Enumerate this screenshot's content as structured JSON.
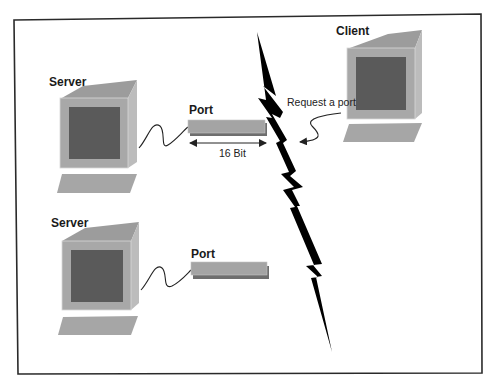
{
  "diagram": {
    "type": "client-server port request illustration",
    "nodes": {
      "server_top": {
        "label": "Server",
        "port_label": "Port",
        "port_width_label": "16 Bit"
      },
      "server_bottom": {
        "label": "Server",
        "port_label": "Port"
      },
      "client": {
        "label": "Client",
        "request_label": "Request a port"
      }
    },
    "separator": "lightning-bolt",
    "colors": {
      "frame": "#2a2a2a",
      "monitor_body": "#a8a8a8",
      "monitor_side": "#bcbcbc",
      "monitor_top": "#9c9c9c",
      "screen": "#5a5a5a",
      "keyboard": "#a6a6a6",
      "port_bar": "#a4a4a4",
      "port_shadow": "#6e6e6e",
      "bolt": "#000000",
      "cable": "#222222"
    }
  }
}
